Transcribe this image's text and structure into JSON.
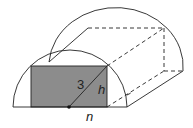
{
  "diagram": {
    "type": "half-cylinder with inscribed rectangular prism",
    "labels": {
      "radius": "3",
      "height": "h",
      "half_width": "n"
    },
    "colors": {
      "stroke": "#222222",
      "rect_fill": "#8c8c8c",
      "background": "#ffffff"
    }
  }
}
